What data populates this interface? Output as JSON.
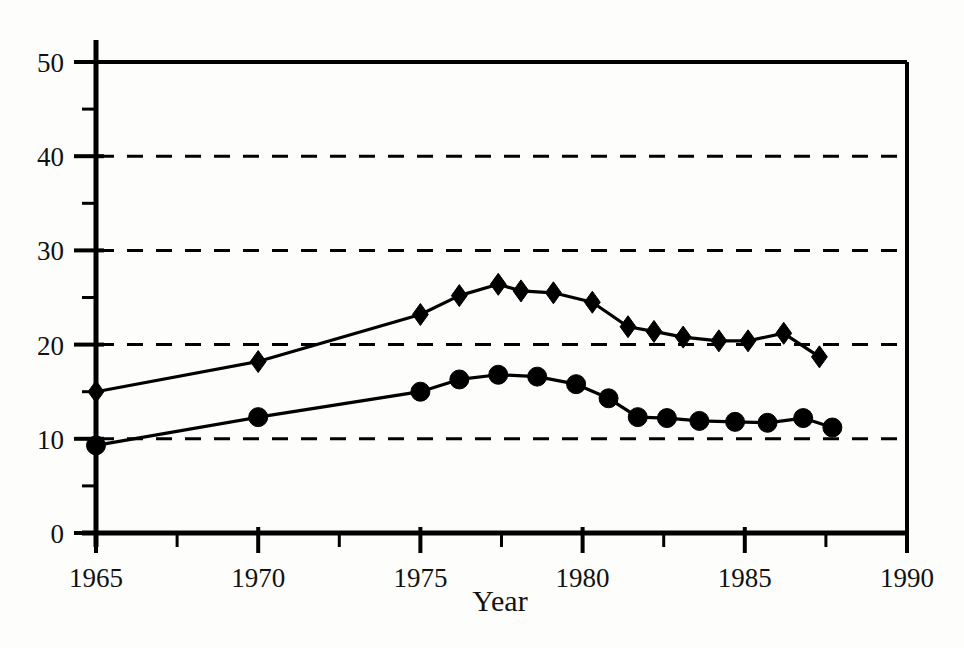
{
  "chart_data": {
    "type": "line",
    "title": "",
    "subtitle": "",
    "xlabel": "Year",
    "ylabel": "",
    "xlim": [
      1965,
      1990
    ],
    "ylim": [
      0,
      50
    ],
    "xticks": [
      1965,
      1970,
      1975,
      1980,
      1985,
      1990
    ],
    "xtick_labels": [
      "1965",
      "1970",
      "1975",
      "1980",
      "1985",
      "1990"
    ],
    "xminor_ticks": [
      1967.5,
      1972.5,
      1977.5,
      1982.5,
      1987.5
    ],
    "yticks": [
      0,
      10,
      20,
      30,
      40,
      50
    ],
    "ytick_labels": [
      "0",
      "10",
      "20",
      "30",
      "40",
      "50"
    ],
    "yminor_ticks": [
      5,
      15,
      25,
      35,
      45
    ],
    "gridlines_y": [
      10,
      20,
      30,
      40
    ],
    "grid": "horizontal-dashed",
    "legend": "none",
    "legend_position": "none",
    "series": [
      {
        "name": "diamond-series",
        "marker": "diamond",
        "color": "#000000",
        "x": [
          1965,
          1970,
          1975,
          1976.2,
          1977.4,
          1978.1,
          1979.1,
          1980.3,
          1981.4,
          1982.2,
          1983.1,
          1984.2,
          1985.1,
          1986.2,
          1987.3
        ],
        "values": [
          15.0,
          18.2,
          23.2,
          25.2,
          26.4,
          25.7,
          25.5,
          24.5,
          21.9,
          21.4,
          20.8,
          20.4,
          20.4,
          21.2,
          18.7
        ]
      },
      {
        "name": "circle-series",
        "marker": "circle",
        "color": "#000000",
        "x": [
          1965,
          1970,
          1975,
          1976.2,
          1977.4,
          1978.6,
          1979.8,
          1980.8,
          1981.7,
          1982.6,
          1983.6,
          1984.7,
          1985.7,
          1986.8,
          1987.7
        ],
        "values": [
          9.3,
          12.3,
          15.0,
          16.3,
          16.8,
          16.6,
          15.8,
          14.3,
          12.3,
          12.2,
          11.9,
          11.8,
          11.7,
          12.2,
          11.2
        ]
      }
    ]
  },
  "axis": {
    "x_title": "Year"
  },
  "colors": {
    "ink": "#000000",
    "background": "#fdfdfb"
  }
}
